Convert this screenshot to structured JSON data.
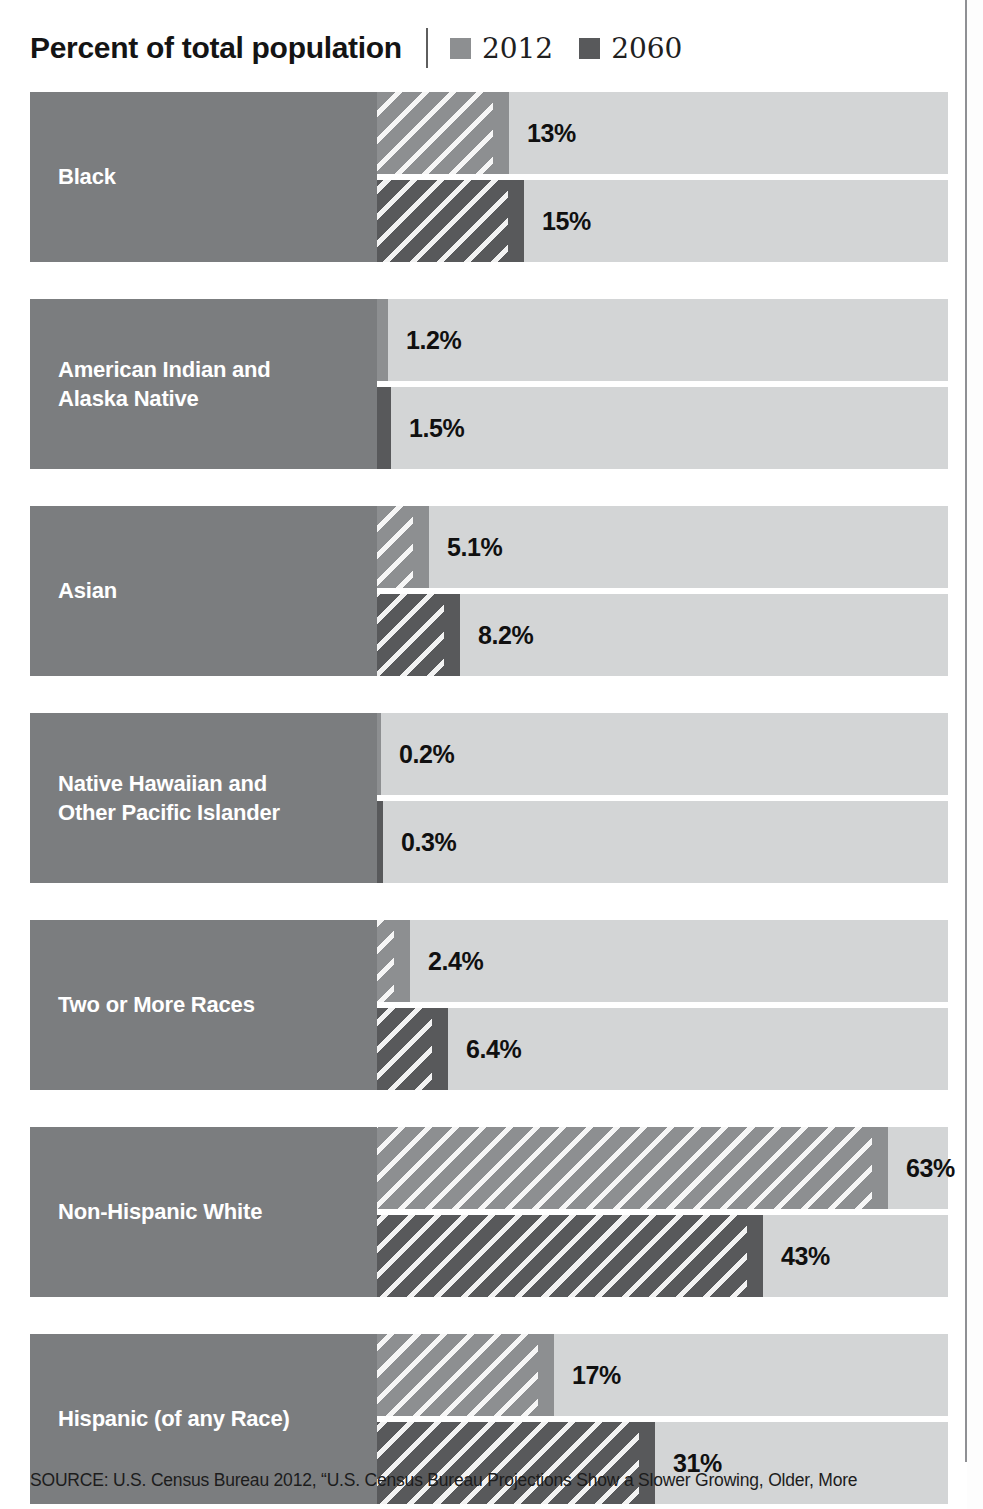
{
  "header": {
    "title": "Percent of total population",
    "legend": [
      {
        "label": "2012",
        "color": "#8d8f91",
        "swatch_name": "legend-swatch-2012"
      },
      {
        "label": "2060",
        "color": "#58595b",
        "swatch_name": "legend-swatch-2060"
      }
    ]
  },
  "footer": {
    "source": "SOURCE: U.S. Census Bureau 2012, “U.S. Census Bureau Projections Show a Slower Growing, Older, More"
  },
  "chart_data": {
    "type": "bar",
    "orientation": "horizontal",
    "title": "Percent of total population",
    "xlabel": "",
    "ylabel": "",
    "xlim": [
      0,
      70
    ],
    "grid": false,
    "legend_position": "top-right",
    "categories": [
      "Black",
      "American Indian and Alaska Native",
      "Asian",
      "Native Hawaiian and Other Pacific Islander",
      "Two or More Races",
      "Non-Hispanic White",
      "Hispanic (of any Race)"
    ],
    "series": [
      {
        "name": "2012",
        "color": "#8d8f91",
        "values": [
          13,
          1.2,
          5.1,
          0.2,
          2.4,
          63,
          17
        ],
        "labels": [
          "13%",
          "1.2%",
          "5.1%",
          "0.2%",
          "2.4%",
          "63%",
          "17%"
        ]
      },
      {
        "name": "2060",
        "color": "#58595b",
        "values": [
          15,
          1.5,
          8.2,
          0.3,
          6.4,
          43,
          31
        ],
        "labels": [
          "15%",
          "1.5%",
          "8.2%",
          "0.3%",
          "6.4%",
          "43%",
          "31%"
        ]
      }
    ]
  },
  "groups": [
    {
      "label": "Black",
      "label_lines": [
        "Black"
      ],
      "top": {
        "series": "2012",
        "value": 13,
        "label": "13%",
        "width_px": 132
      },
      "bottom": {
        "series": "2060",
        "value": 15,
        "label": "15%",
        "width_px": 147
      }
    },
    {
      "label": "American Indian and Alaska Native",
      "label_lines": [
        "American Indian and",
        "Alaska Native"
      ],
      "top": {
        "series": "2012",
        "value": 1.2,
        "label": "1.2%",
        "width_px": 11
      },
      "bottom": {
        "series": "2060",
        "value": 1.5,
        "label": "1.5%",
        "width_px": 14
      }
    },
    {
      "label": "Asian",
      "label_lines": [
        "Asian"
      ],
      "top": {
        "series": "2012",
        "value": 5.1,
        "label": "5.1%",
        "width_px": 52
      },
      "bottom": {
        "series": "2060",
        "value": 8.2,
        "label": "8.2%",
        "width_px": 83
      }
    },
    {
      "label": "Native Hawaiian and Other Pacific Islander",
      "label_lines": [
        "Native Hawaiian and",
        "Other Pacific Islander"
      ],
      "top": {
        "series": "2012",
        "value": 0.2,
        "label": "0.2%",
        "width_px": 4
      },
      "bottom": {
        "series": "2060",
        "value": 0.3,
        "label": "0.3%",
        "width_px": 6
      }
    },
    {
      "label": "Two or More Races",
      "label_lines": [
        "Two or More Races"
      ],
      "top": {
        "series": "2012",
        "value": 2.4,
        "label": "2.4%",
        "width_px": 33
      },
      "bottom": {
        "series": "2060",
        "value": 6.4,
        "label": "6.4%",
        "width_px": 71
      }
    },
    {
      "label": "Non-Hispanic White",
      "label_lines": [
        "Non-Hispanic White"
      ],
      "top": {
        "series": "2012",
        "value": 63,
        "label": "63%",
        "width_px": 511
      },
      "bottom": {
        "series": "2060",
        "value": 43,
        "label": "43%",
        "width_px": 386
      }
    },
    {
      "label": "Hispanic (of any Race)",
      "label_lines": [
        "Hispanic (of any Race)"
      ],
      "top": {
        "series": "2012",
        "value": 17,
        "label": "17%",
        "width_px": 177
      },
      "bottom": {
        "series": "2060",
        "value": 31,
        "label": "31%",
        "width_px": 278
      }
    }
  ]
}
